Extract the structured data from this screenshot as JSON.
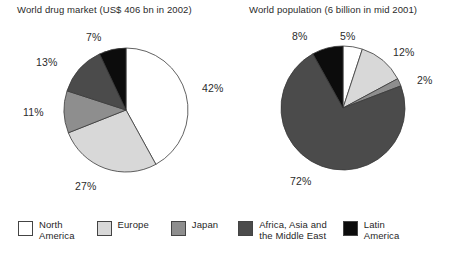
{
  "charts": {
    "left": {
      "title": "World drug market (US$ 406 bn in 2002)",
      "labels": {
        "p1": "42%",
        "p2": "27%",
        "p3": "11%",
        "p4": "13%",
        "p5": "7%"
      }
    },
    "right": {
      "title": "World population (6 billion in mid 2001)",
      "labels": {
        "p1": "5%",
        "p2": "12%",
        "p3": "2%",
        "p4": "72%",
        "p5": "8%"
      }
    }
  },
  "legend": {
    "items": [
      {
        "label": "North\nAmerica",
        "color": "#ffffff"
      },
      {
        "label": "Europe",
        "color": "#d8d8d8"
      },
      {
        "label": "Japan",
        "color": "#8e8e8e"
      },
      {
        "label": "Africa, Asia and\nthe Middle East",
        "color": "#4b4b4b"
      },
      {
        "label": "Latin\nAmerica",
        "color": "#0c0c0c"
      }
    ]
  },
  "chart_data": [
    {
      "type": "pie",
      "title": "World drug market (US$ 406 bn in 2002)",
      "categories": [
        "North America",
        "Europe",
        "Japan",
        "Africa, Asia and the Middle East",
        "Latin America"
      ],
      "values": [
        42,
        27,
        11,
        13,
        7
      ],
      "unit": "%",
      "colors": [
        "#ffffff",
        "#d8d8d8",
        "#8e8e8e",
        "#4b4b4b",
        "#0c0c0c"
      ],
      "legend_position": "bottom",
      "start_angle_deg": 0,
      "direction": "clockwise",
      "grid": false
    },
    {
      "type": "pie",
      "title": "World population (6 billion in mid 2001)",
      "categories": [
        "North America",
        "Europe",
        "Japan",
        "Africa, Asia and the Middle East",
        "Latin America"
      ],
      "values": [
        5,
        12,
        2,
        72,
        8
      ],
      "unit": "%",
      "colors": [
        "#ffffff",
        "#d8d8d8",
        "#8e8e8e",
        "#4b4b4b",
        "#0c0c0c"
      ],
      "legend_position": "bottom",
      "start_angle_deg": 0,
      "direction": "clockwise",
      "grid": false
    }
  ]
}
